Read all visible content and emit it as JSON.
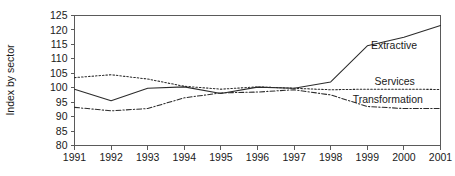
{
  "chart_data": {
    "type": "line",
    "title": "",
    "subtitle": "",
    "xlabel": "",
    "ylabel": "Index by sector",
    "xlim": [
      1991,
      2001
    ],
    "ylim": [
      80,
      125
    ],
    "ytick_step": 5,
    "grid": false,
    "legend_position": "inline-right-of-series",
    "x": [
      1991,
      1992,
      1993,
      1994,
      1995,
      1996,
      1997,
      1998,
      1999,
      2000,
      2001
    ],
    "categories": [
      "1991",
      "1992",
      "1993",
      "1994",
      "1995",
      "1996",
      "1997",
      "1998",
      "1999",
      "2000",
      "2001"
    ],
    "ytick_labels": [
      "80",
      "85",
      "90",
      "95",
      "100",
      "105",
      "110",
      "115",
      "120",
      "125"
    ],
    "ytick_values": [
      80,
      85,
      90,
      95,
      100,
      105,
      110,
      115,
      120,
      125
    ],
    "series": [
      {
        "name": "Extractive",
        "style": "solid",
        "color": "#2b2b2b",
        "values": [
          99.5,
          95.5,
          99.8,
          100.3,
          98.0,
          100.2,
          99.8,
          102.0,
          114.5,
          117.5,
          121.5
        ]
      },
      {
        "name": "Services",
        "style": "dotted",
        "color": "#2b2b2b",
        "values": [
          103.5,
          104.5,
          103.0,
          100.5,
          99.5,
          100.3,
          99.8,
          99.3,
          99.5,
          99.5,
          99.4
        ]
      },
      {
        "name": "Transformation",
        "style": "dash-dot",
        "color": "#2b2b2b",
        "values": [
          93.2,
          92.0,
          92.8,
          96.5,
          98.2,
          98.5,
          99.3,
          97.5,
          93.5,
          92.8,
          92.8
        ]
      }
    ],
    "annotations": [
      {
        "text": "Extractive",
        "x": 1999.1,
        "y": 114.6
      },
      {
        "text": "Services",
        "x": 1999.2,
        "y": 102.3
      },
      {
        "text": "Transformation",
        "x": 1998.6,
        "y": 95.8
      }
    ]
  },
  "axis": {
    "y_title": "Index by sector"
  }
}
